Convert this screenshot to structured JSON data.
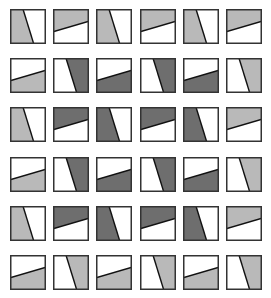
{
  "colors": {
    "light": "#b9b9b9",
    "dark": "#6e6e6e",
    "white": "#ffffff",
    "border": "#333333"
  },
  "grid": {
    "cols": 6,
    "rows": 6,
    "x0": 10,
    "y0": 9,
    "dx": 43.2,
    "dy": 49.2,
    "cells": [
      [
        "V:light",
        "HT:light",
        "V:light",
        "HT:light",
        "V:light",
        "HT:light"
      ],
      [
        "HB:light",
        "VR:dark",
        "HB:dark",
        "VR:dark",
        "HB:dark",
        "VR:light"
      ],
      [
        "V:light",
        "HT:dark",
        "V:dark",
        "HT:dark",
        "V:dark",
        "HT:light"
      ],
      [
        "HB:light",
        "VR:dark",
        "HB:dark",
        "VR:dark",
        "HB:dark",
        "VR:light"
      ],
      [
        "V:light",
        "HT:dark",
        "V:dark",
        "HT:dark",
        "V:dark",
        "HT:light"
      ],
      [
        "HB:light",
        "VR:light",
        "HB:light",
        "VR:light",
        "HB:light",
        "VR:light"
      ]
    ]
  }
}
